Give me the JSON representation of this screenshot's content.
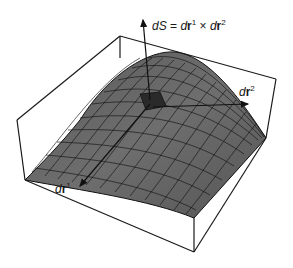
{
  "figure": {
    "labels": {
      "dS": {
        "lhs": "dS",
        "eq": " = ",
        "t1": "d",
        "r1": "r",
        "s1": "1",
        "times": " × ",
        "t2": "d",
        "r2": "r",
        "s2": "2"
      },
      "dr2": {
        "d": "d",
        "r": "r",
        "sup": "2"
      },
      "dr1": {
        "d": "d",
        "r": "r",
        "sup": "1"
      }
    },
    "colors": {
      "surface_light": "#8a8a8a",
      "surface_dark": "#3e3e3e",
      "grid": "#111111",
      "patch": "#2a2a2a",
      "box": "#1a1a1a"
    }
  }
}
